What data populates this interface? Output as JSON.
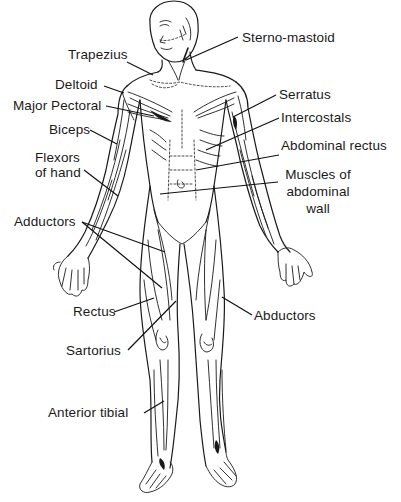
{
  "diagram": {
    "type": "anatomical-muscle-chart",
    "colors": {
      "ink": "#1a1a1a",
      "background": "#ffffff"
    },
    "labels": {
      "sterno_mastoid": "Sterno-mastoid",
      "trapezius": "Trapezius",
      "deltoid": "Deltoid",
      "major_pectoral": "Major Pectoral",
      "serratus": "Serratus",
      "intercostals": "Intercostals",
      "biceps": "Biceps",
      "abdominal_rectus": "Abdominal rectus",
      "flexors_of_hand_1": "Flexors",
      "flexors_of_hand_2": "of hand",
      "muscles_of_abdominal_wall_1": "Muscles of",
      "muscles_of_abdominal_wall_2": "abdominal",
      "muscles_of_abdominal_wall_3": "wall",
      "adductors": "Adductors",
      "rectus": "Rectus",
      "abductors": "Abductors",
      "sartorius": "Sartorius",
      "anterior_tibial": "Anterior tibial"
    }
  }
}
